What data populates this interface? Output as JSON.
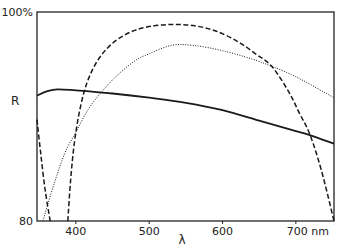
{
  "chart_data": {
    "type": "line",
    "title": "",
    "xlabel": "λ",
    "ylabel": "R",
    "x_unit": "nm",
    "xlim": [
      347,
      752
    ],
    "ylim": [
      80,
      100
    ],
    "x_ticks": [
      400,
      500,
      600,
      700
    ],
    "x_tick_labels": [
      "400",
      "500",
      "600",
      "700 nm"
    ],
    "y_ticks": [
      80,
      100
    ],
    "y_tick_labels": [
      "80",
      "100%"
    ],
    "grid": false,
    "legend": null,
    "series": [
      {
        "name": "solid",
        "style": "solid",
        "points": [
          [
            347,
            92.0
          ],
          [
            360,
            92.4
          ],
          [
            375,
            92.6
          ],
          [
            400,
            92.5
          ],
          [
            450,
            92.2
          ],
          [
            500,
            91.8
          ],
          [
            550,
            91.3
          ],
          [
            600,
            90.6
          ],
          [
            650,
            89.6
          ],
          [
            700,
            88.6
          ],
          [
            720,
            88.2
          ],
          [
            752,
            87.4
          ]
        ]
      },
      {
        "name": "dotted",
        "style": "dotted",
        "points": [
          [
            355,
            80.0
          ],
          [
            370,
            83.5
          ],
          [
            385,
            86.5
          ],
          [
            400,
            88.5
          ],
          [
            420,
            91.0
          ],
          [
            450,
            93.5
          ],
          [
            480,
            95.3
          ],
          [
            500,
            96.0
          ],
          [
            530,
            96.8
          ],
          [
            560,
            96.8
          ],
          [
            600,
            96.3
          ],
          [
            640,
            95.5
          ],
          [
            667,
            94.8
          ],
          [
            700,
            93.8
          ],
          [
            752,
            91.8
          ]
        ]
      },
      {
        "name": "dashed",
        "style": "dashed",
        "points": [
          [
            389,
            80.0
          ],
          [
            393,
            84.0
          ],
          [
            398,
            87.5
          ],
          [
            405,
            90.5
          ],
          [
            415,
            93.2
          ],
          [
            430,
            95.4
          ],
          [
            450,
            97.0
          ],
          [
            475,
            98.1
          ],
          [
            500,
            98.6
          ],
          [
            530,
            98.8
          ],
          [
            560,
            98.7
          ],
          [
            590,
            98.2
          ],
          [
            620,
            97.2
          ],
          [
            645,
            96.0
          ],
          [
            667,
            94.8
          ],
          [
            690,
            92.4
          ],
          [
            705,
            90.3
          ],
          [
            719,
            88.3
          ],
          [
            735,
            84.8
          ],
          [
            752,
            80.0
          ]
        ]
      },
      {
        "name": "dashed-left-branch",
        "style": "dashed",
        "points": [
          [
            347,
            89.7
          ],
          [
            352,
            86.5
          ],
          [
            358,
            83.0
          ],
          [
            365,
            80.0
          ]
        ]
      }
    ]
  }
}
